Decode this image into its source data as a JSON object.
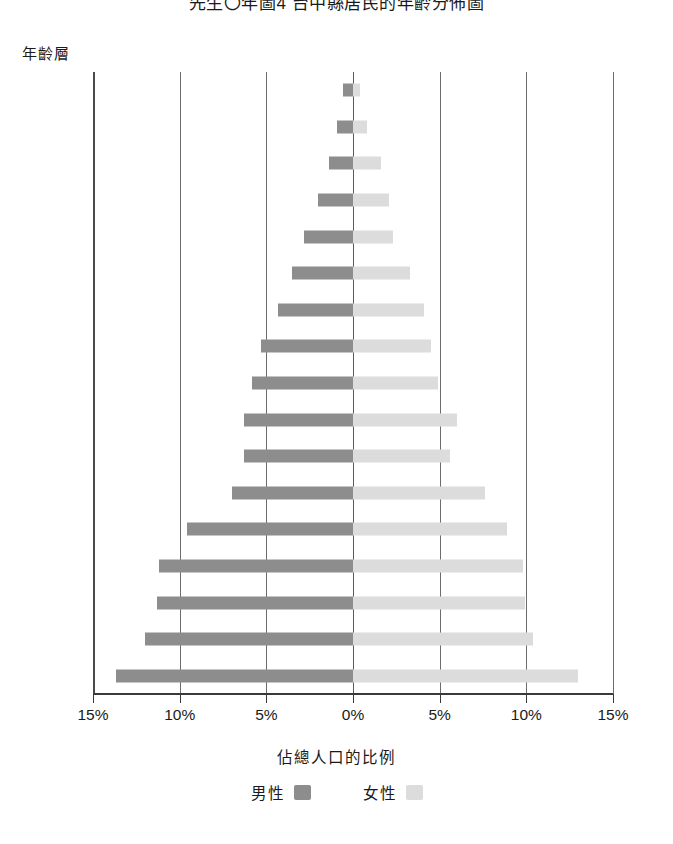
{
  "chart": {
    "title": "先生〇年圖4 台中縣居民的年齡分佈圖",
    "y_axis_title": "年齡層",
    "x_axis_title": "佔總人口的比例",
    "legend": [
      {
        "label": "男性",
        "key": "male",
        "color": "#8d8d8d"
      },
      {
        "label": "女性",
        "key": "female",
        "color": "#dcdcdc"
      }
    ],
    "x_tick_labels": [
      "15%",
      "10%",
      "5%",
      "0%",
      "5%",
      "10%",
      "15%"
    ],
    "x_tick_values": [
      -15,
      -10,
      -5,
      0,
      5,
      10,
      15
    ]
  },
  "chart_data": {
    "type": "bar",
    "subtype": "population-pyramid",
    "title": "先生〇年圖4 台中縣居民的年齡分佈圖",
    "xlabel": "佔總人口的比例",
    "ylabel": "年齡層",
    "xlim": [
      -15,
      15
    ],
    "xtick_labels": [
      "15%",
      "10%",
      "5%",
      "0%",
      "5%",
      "10%",
      "15%"
    ],
    "grid": true,
    "legend_position": "bottom",
    "categories": [
      "80+",
      "75–79",
      "70–74",
      "65–69",
      "60–64",
      "55–59",
      "50–54",
      "45–49",
      "40–44",
      "35–39",
      "30–34",
      "25–29",
      "20–24",
      "15–19",
      "10–14",
      "5–9",
      "0–4"
    ],
    "series": [
      {
        "name": "男性",
        "key": "male",
        "color": "#8d8d8d",
        "values": [
          0.6,
          0.9,
          1.4,
          2.0,
          2.8,
          3.5,
          4.3,
          5.3,
          5.8,
          6.3,
          6.3,
          7.0,
          9.6,
          11.2,
          11.3,
          12.0,
          13.7
        ]
      },
      {
        "name": "女性",
        "key": "female",
        "color": "#dcdcdc",
        "values": [
          0.4,
          0.8,
          1.6,
          2.1,
          2.3,
          3.3,
          4.1,
          4.5,
          4.9,
          6.0,
          5.6,
          7.6,
          8.9,
          9.8,
          9.9,
          10.4,
          13.0
        ]
      }
    ]
  }
}
